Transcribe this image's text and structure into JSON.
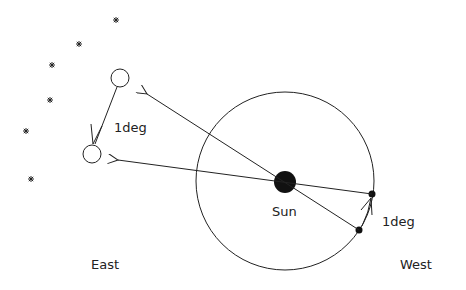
{
  "labels": {
    "sun": "Sun",
    "deg_sky": "1deg",
    "deg_orbit": "1deg",
    "east": "East",
    "west": "West"
  },
  "stars": [
    {
      "x": 116,
      "y": 20
    },
    {
      "x": 79,
      "y": 44
    },
    {
      "x": 52,
      "y": 65
    },
    {
      "x": 50,
      "y": 100
    },
    {
      "x": 26,
      "y": 131
    },
    {
      "x": 31,
      "y": 179
    }
  ],
  "colors": {
    "ink": "#222222",
    "background": "#ffffff"
  }
}
